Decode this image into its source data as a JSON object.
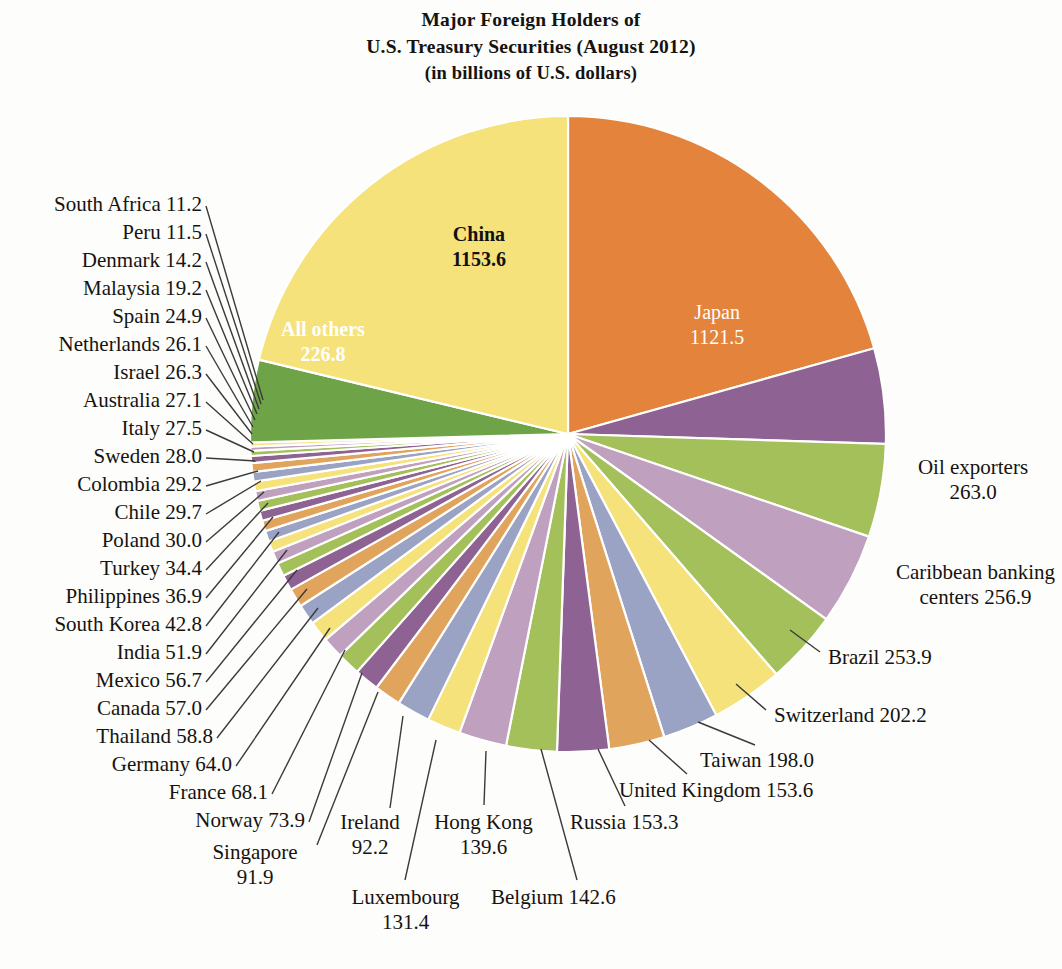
{
  "title": {
    "line1": "Major Foreign Holders of",
    "line2": "U.S. Treasury Securities (August 2012)",
    "line3": "(in billions of U.S. dollars)"
  },
  "chart_data": {
    "type": "pie",
    "title": "Major Foreign Holders of U.S. Treasury Securities (August 2012)",
    "subtitle": "(in billions of U.S. dollars)",
    "unit": "billions of U.S. dollars",
    "legend": "none",
    "grid": false,
    "start_angle_deg": -90,
    "direction": "clockwise",
    "categories": [
      "Japan",
      "Oil exporters",
      "Caribbean banking centers",
      "Brazil",
      "Switzerland",
      "Taiwan",
      "United Kingdom",
      "Russia",
      "Belgium",
      "Hong Kong",
      "Luxembourg",
      "Ireland",
      "Singapore",
      "Norway",
      "France",
      "Germany",
      "Thailand",
      "Canada",
      "Mexico",
      "India",
      "South Korea",
      "Philippines",
      "Turkey",
      "Poland",
      "Chile",
      "Colombia",
      "Sweden",
      "Italy",
      "Australia",
      "Israel",
      "Netherlands",
      "Spain",
      "Malaysia",
      "Denmark",
      "Peru",
      "South Africa",
      "All others",
      "China"
    ],
    "values": [
      1121.5,
      263.0,
      256.9,
      253.9,
      202.2,
      198.0,
      153.6,
      153.3,
      142.6,
      139.6,
      131.4,
      92.2,
      91.9,
      73.9,
      68.1,
      64.0,
      58.8,
      57.0,
      56.7,
      51.9,
      42.8,
      36.9,
      34.4,
      30.0,
      29.7,
      29.2,
      28.0,
      27.5,
      27.1,
      26.3,
      26.1,
      24.9,
      19.2,
      14.2,
      11.5,
      11.2,
      226.8,
      1153.6
    ],
    "colors": [
      "#e4843c",
      "#8e6292",
      "#a4c05a",
      "#bfa0be",
      "#a4c05a",
      "#f5e27a",
      "#9ba3c4",
      "#e0a45c",
      "#8e6292",
      "#a4c05a",
      "#bfa0be",
      "#f5e27a",
      "#9ba3c4",
      "#e0a45c",
      "#8e6292",
      "#a4c05a",
      "#bfa0be",
      "#f5e27a",
      "#9ba3c4",
      "#e0a45c",
      "#8e6292",
      "#a4c05a",
      "#bfa0be",
      "#f5e27a",
      "#9ba3c4",
      "#e0a45c",
      "#8e6292",
      "#a4c05a",
      "#bfa0be",
      "#f5e27a",
      "#9ba3c4",
      "#e0a45c",
      "#8e6292",
      "#a4c05a",
      "#bfa0be",
      "#f5e27a",
      "#6fa348",
      "#f5e27a"
    ]
  },
  "geometry": {
    "cx": 568,
    "cy": 434,
    "r": 318
  },
  "inside_labels": [
    {
      "name": "China",
      "value": "1153.6",
      "x": 452,
      "y": 222,
      "style": "dark"
    },
    {
      "name": "Japan",
      "value": "1121.5",
      "x": 690,
      "y": 300,
      "style": "light"
    },
    {
      "name": "All others",
      "value": "226.8",
      "x": 281,
      "y": 317,
      "style": "lightbold"
    }
  ],
  "left_labels": [
    {
      "name": "South Africa",
      "value": "11.2",
      "x": 32,
      "y": 192,
      "lx": 202,
      "ly": 206,
      "px": 263,
      "py": 400
    },
    {
      "name": "Peru",
      "value": "11.5",
      "x": 101,
      "y": 220,
      "lx": 202,
      "ly": 234,
      "px": 261,
      "py": 404
    },
    {
      "name": "Denmark",
      "value": "14.2",
      "x": 61,
      "y": 248,
      "lx": 202,
      "ly": 262,
      "px": 259,
      "py": 409
    },
    {
      "name": "Malaysia",
      "value": "19.2",
      "x": 61,
      "y": 276,
      "lx": 202,
      "ly": 290,
      "px": 257,
      "py": 414
    },
    {
      "name": "Spain",
      "value": "24.9",
      "x": 89,
      "y": 304,
      "lx": 202,
      "ly": 318,
      "px": 255,
      "py": 420
    },
    {
      "name": "Netherlands",
      "value": "26.1",
      "x": 33,
      "y": 332,
      "lx": 202,
      "ly": 346,
      "px": 253,
      "py": 427
    },
    {
      "name": "Israel",
      "value": "26.3",
      "x": 89,
      "y": 360,
      "lx": 202,
      "ly": 374,
      "px": 252,
      "py": 434
    },
    {
      "name": "Australia",
      "value": "27.1",
      "x": 61,
      "y": 388,
      "lx": 202,
      "ly": 402,
      "px": 253,
      "py": 444
    },
    {
      "name": "Italy",
      "value": "27.5",
      "x": 101,
      "y": 416,
      "lx": 202,
      "ly": 430,
      "px": 254,
      "py": 452
    },
    {
      "name": "Sweden",
      "value": "28.0",
      "x": 75,
      "y": 444,
      "lx": 202,
      "ly": 458,
      "px": 256,
      "py": 461
    },
    {
      "name": "Colombia",
      "value": "29.2",
      "x": 55,
      "y": 472,
      "lx": 202,
      "ly": 486,
      "px": 258,
      "py": 471
    },
    {
      "name": "Chile",
      "value": "29.7",
      "x": 97,
      "y": 500,
      "lx": 202,
      "ly": 514,
      "px": 261,
      "py": 481
    },
    {
      "name": "Poland",
      "value": "30.0",
      "x": 73,
      "y": 528,
      "lx": 202,
      "ly": 542,
      "px": 264,
      "py": 492
    },
    {
      "name": "Turkey",
      "value": "34.4",
      "x": 73,
      "y": 556,
      "lx": 202,
      "ly": 570,
      "px": 268,
      "py": 503
    },
    {
      "name": "Philippines",
      "value": "36.9",
      "x": 31,
      "y": 584,
      "lx": 202,
      "ly": 598,
      "px": 273,
      "py": 517
    },
    {
      "name": "South Korea",
      "value": "42.8",
      "x": 19,
      "y": 612,
      "lx": 202,
      "ly": 626,
      "px": 279,
      "py": 532
    },
    {
      "name": "India",
      "value": "51.9",
      "x": 87,
      "y": 640,
      "lx": 202,
      "ly": 654,
      "px": 287,
      "py": 550
    },
    {
      "name": "Mexico",
      "value": "56.7",
      "x": 67,
      "y": 668,
      "lx": 202,
      "ly": 682,
      "px": 297,
      "py": 570
    },
    {
      "name": "Canada",
      "value": "57.0",
      "x": 67,
      "y": 696,
      "lx": 202,
      "ly": 710,
      "px": 307,
      "py": 589
    },
    {
      "name": "Thailand",
      "value": "58.8",
      "x": 59,
      "y": 724,
      "lx": 213,
      "ly": 738,
      "px": 318,
      "py": 608
    },
    {
      "name": "Germany",
      "value": "64.0",
      "x": 73,
      "y": 752,
      "lx": 232,
      "ly": 766,
      "px": 330,
      "py": 628
    },
    {
      "name": "France",
      "value": "68.1",
      "x": 143,
      "y": 780,
      "lx": 268,
      "ly": 794,
      "px": 345,
      "py": 650
    },
    {
      "name": "Norway",
      "value": "73.9",
      "x": 165,
      "y": 808,
      "lx": 305,
      "ly": 822,
      "px": 362,
      "py": 673
    }
  ],
  "multiline_labels": [
    {
      "name": "Singapore",
      "value": "91.9",
      "x": 200,
      "y": 840,
      "w": 110,
      "lx": 317,
      "ly": 845,
      "px": 378,
      "py": 692
    },
    {
      "name": "Ireland",
      "value": "92.2",
      "x": 325,
      "y": 810,
      "w": 90,
      "lx": 390,
      "ly": 808,
      "px": 403,
      "py": 716
    },
    {
      "name": "Luxembourg",
      "value": "131.4",
      "x": 338,
      "y": 885,
      "w": 135,
      "lx": 405,
      "ly": 880,
      "px": 436,
      "py": 740
    },
    {
      "name": "Hong Kong",
      "value": "139.6",
      "x": 421,
      "y": 810,
      "w": 125,
      "lx": 484,
      "ly": 805,
      "px": 486,
      "py": 751
    }
  ],
  "bottom_labels": [
    {
      "name": "Belgium",
      "value": "142.6",
      "x": 491,
      "y": 885,
      "lx": 577,
      "ly": 880,
      "px": 541,
      "py": 749
    },
    {
      "name": "Russia",
      "value": "153.3",
      "x": 570,
      "y": 810,
      "lx": 625,
      "ly": 806,
      "px": 598,
      "py": 749
    },
    {
      "name": "United Kingdom",
      "value": "153.6",
      "x": 619,
      "y": 778,
      "lx": 687,
      "ly": 774,
      "px": 649,
      "py": 740
    },
    {
      "name": "Taiwan",
      "value": "198.0",
      "x": 700,
      "y": 748,
      "lx": 755,
      "ly": 745,
      "px": 698,
      "py": 722
    }
  ],
  "right_labels": [
    {
      "name": "Oil exporters",
      "value": "263.0",
      "x": 893,
      "y": 455,
      "w": 160,
      "two": true,
      "lx": null,
      "ly": null,
      "px": null,
      "py": null
    },
    {
      "name": "Caribbean banking",
      "value": "centers 256.9",
      "x": 888,
      "y": 560,
      "w": 175,
      "two": true,
      "lx": null,
      "ly": null,
      "px": null,
      "py": null
    },
    {
      "name": "Brazil",
      "value": "253.9",
      "x": 828,
      "y": 645,
      "w": 150,
      "two": false,
      "lx": 820,
      "ly": 652,
      "px": 790,
      "py": 630
    },
    {
      "name": "Switzerland",
      "value": "202.2",
      "x": 774,
      "y": 703,
      "w": 180,
      "two": false,
      "lx": 766,
      "ly": 710,
      "px": 736,
      "py": 684
    }
  ]
}
